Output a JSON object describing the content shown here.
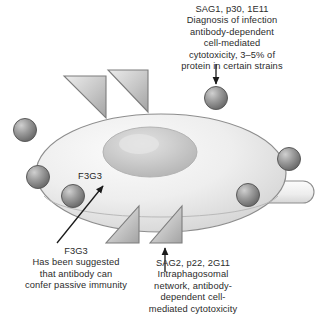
{
  "figure": {
    "type": "biological-cell-diagram",
    "background_color": "#ffffff",
    "text_color": "#2b2b2b"
  },
  "labels": {
    "top": {
      "name": "SAG1, p30, 1E11",
      "text": "SAG1, p30, 1E11\nDiagnosis of infection\nantibody-dependent\ncell-mediated\ncytotoxicity, 3–5% of\nprotein in certain strains"
    },
    "bottom_left": {
      "name": "F3G3",
      "text": "F3G3\nHas been suggested\nthat antibody can\nconfer passive immunity"
    },
    "bottom_right": {
      "name": "SAG2, p22, 2G11",
      "text": "SAG2, p22, 2G11\nIntraphagosomal\nnetwork, antibody-\ndependent cell-\nmediated cytotoxicity"
    },
    "inline_f3g3": {
      "text": "F3G3"
    }
  },
  "cell": {
    "body_fill_light": "#f2f2f2",
    "body_fill_mid": "#dcdcdc",
    "body_outline": "#8d8d8d",
    "nucleus_fill": "#c9c9c9",
    "nucleus_outline": "#b3b3b3",
    "protrusion_fill": "#efefef"
  },
  "sphere": {
    "count": 6,
    "fill_light": "#c2c2c2",
    "fill_dark": "#6e6e6e",
    "outline": "#5a5a5a"
  },
  "triangle": {
    "count": 4,
    "fill_light": "#e3e3e3",
    "fill_dark": "#a8a8a8",
    "outline": "#7d7d7d"
  },
  "connectors": {
    "count": 3,
    "color": "#1a1a1a"
  }
}
